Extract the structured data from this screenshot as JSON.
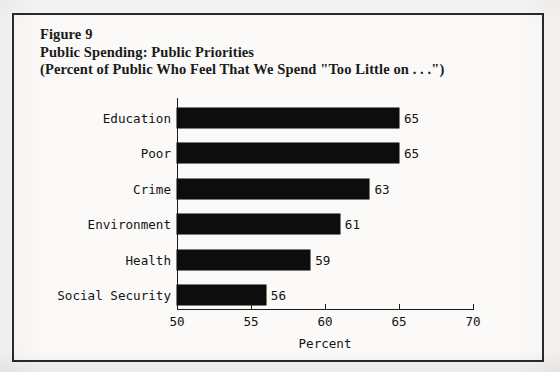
{
  "figure": {
    "frame_color": "#2a2a2a",
    "background_color": "#f8f7f5",
    "title_lines": [
      "Figure 9",
      "Public Spending:  Public Priorities",
      "(Percent of Public Who Feel That We Spend \"Too Little on . . .\")"
    ],
    "title_line_1": "Figure 9",
    "title_line_2": "Public Spending:  Public Priorities",
    "title_line_3": "(Percent of Public Who Feel That We Spend \"Too Little on . . .\")"
  },
  "chart_data": {
    "type": "bar",
    "orientation": "horizontal",
    "subtitle": "(Percent of Public Who Feel That We Spend \"Too Little on . . .\")",
    "categories": [
      "Education",
      "Poor",
      "Crime",
      "Environment",
      "Health",
      "Social Security"
    ],
    "values": [
      65,
      65,
      63,
      61,
      59,
      56
    ],
    "data_labels": [
      "65",
      "65",
      "63",
      "61",
      "59",
      "56"
    ],
    "xlabel": "Percent",
    "ylabel": "",
    "xlim": [
      50,
      70
    ],
    "xticks": [
      50,
      55,
      60,
      65,
      70
    ],
    "xtick_labels": [
      "50",
      "55",
      "60",
      "65",
      "70"
    ],
    "grid": false,
    "legend": false,
    "bar_color": "#0d0d0d",
    "axis_color": "#1c1c1c"
  }
}
